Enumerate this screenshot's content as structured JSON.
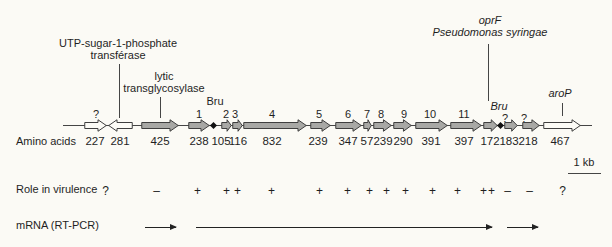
{
  "colors": {
    "filled": "#a8a8a5",
    "open": "#fcfbf6",
    "outline": "#3f3f3f",
    "line": "#454545",
    "background": "#fbfaf5"
  },
  "annotations": {
    "utp_line1": "UTP-sugar-1-phosphate",
    "utp_line2": "transférase",
    "lytic_line1": "lytic",
    "lytic_line2": "transglycosylase",
    "bru_left": "Bru",
    "bru_right": "Bru",
    "oprf": "oprF",
    "pseudomonas": "Pseudomonas syringae",
    "arop": "aroP"
  },
  "rows": {
    "amino_acids_label": "Amino acids",
    "virulence_label": "Role in virulence",
    "mrna_label": "mRNA (RT-PCR)"
  },
  "scale_bar": {
    "label": "1 kb"
  },
  "genes": [
    {
      "name": "unknown-227",
      "number": "?",
      "aa": "227",
      "type": "open",
      "dir": "right"
    },
    {
      "name": "utp-transferase",
      "number": "",
      "aa": "281",
      "type": "open",
      "dir": "left"
    },
    {
      "name": "lytic-transglycosylase",
      "number": "",
      "aa": "425",
      "type": "filled",
      "dir": "right"
    },
    {
      "name": "orf1",
      "number": "1",
      "aa": "238",
      "type": "filled",
      "dir": "right"
    },
    {
      "name": "orf2",
      "number": "2",
      "aa": "105",
      "type": "filled",
      "dir": "right"
    },
    {
      "name": "orf3",
      "number": "3",
      "aa": "116",
      "type": "filled",
      "dir": "right"
    },
    {
      "name": "orf4",
      "number": "4",
      "aa": "832",
      "type": "filled",
      "dir": "right"
    },
    {
      "name": "orf5",
      "number": "5",
      "aa": "239",
      "type": "filled",
      "dir": "right"
    },
    {
      "name": "orf6",
      "number": "6",
      "aa": "347",
      "type": "filled",
      "dir": "right"
    },
    {
      "name": "orf7",
      "number": "7",
      "aa": "57",
      "type": "filled",
      "dir": "right"
    },
    {
      "name": "orf8",
      "number": "8",
      "aa": "239",
      "type": "filled",
      "dir": "right"
    },
    {
      "name": "orf9",
      "number": "9",
      "aa": "290",
      "type": "filled",
      "dir": "right"
    },
    {
      "name": "orf10",
      "number": "10",
      "aa": "391",
      "type": "filled",
      "dir": "right"
    },
    {
      "name": "orf11",
      "number": "11",
      "aa": "397",
      "type": "filled",
      "dir": "right"
    },
    {
      "name": "oprf-homolog",
      "number": "",
      "aa": "172",
      "type": "filled",
      "dir": "right"
    },
    {
      "name": "unknown-183",
      "number": "?",
      "aa": "183",
      "type": "filled",
      "dir": "right"
    },
    {
      "name": "unknown-218",
      "number": "?",
      "aa": "218",
      "type": "filled",
      "dir": "right"
    },
    {
      "name": "arop-homolog",
      "number": "",
      "aa": "467",
      "type": "open",
      "dir": "right"
    }
  ],
  "virulence": {
    "symbols": [
      "?",
      "–",
      "+",
      "+",
      "+",
      "+",
      "+",
      "+",
      "+",
      "+",
      "+",
      "+",
      "+",
      "++",
      "–",
      "–",
      "?"
    ]
  }
}
